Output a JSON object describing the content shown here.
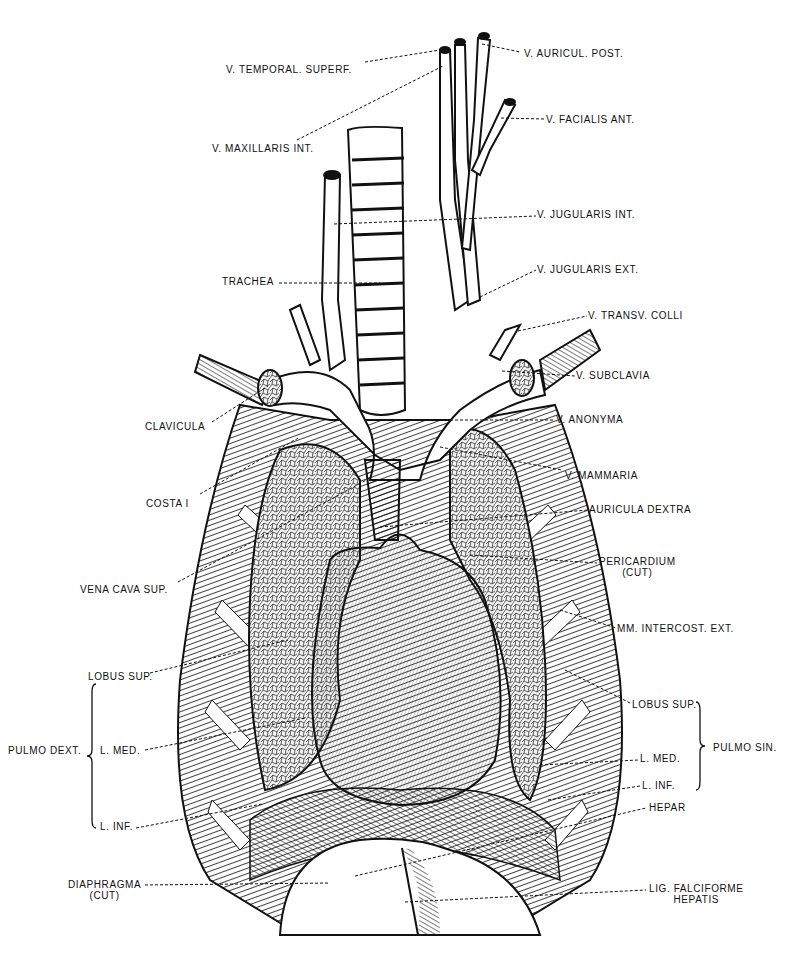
{
  "figure": {
    "colors": {
      "ink": "#111111",
      "paper": "#ffffff",
      "shade": "#2a2a2a",
      "lung": "#e9e9e9"
    }
  },
  "labels": [
    {
      "id": "v-temporal-superf",
      "text": "V. TEMPORAL. SUPERF.",
      "x": 226,
      "y": 64,
      "lx1": 365,
      "ly1": 62,
      "lx2": 440,
      "ly2": 50
    },
    {
      "id": "v-auricul-post",
      "text": "V. AURICUL. POST.",
      "x": 524,
      "y": 48,
      "lx1": 482,
      "ly1": 44,
      "lx2": 520,
      "ly2": 52
    },
    {
      "id": "v-maxillaris-int",
      "text": "V. MAXILLARIS INT.",
      "x": 212,
      "y": 143,
      "lx1": 297,
      "ly1": 140,
      "lx2": 443,
      "ly2": 66
    },
    {
      "id": "v-facialis-ant",
      "text": "V. FACIALIS ANT.",
      "x": 546,
      "y": 114,
      "lx1": 501,
      "ly1": 118,
      "lx2": 544,
      "ly2": 119
    },
    {
      "id": "v-jugularis-int",
      "text": "V. JUGULARIS INT.",
      "x": 537,
      "y": 209,
      "lx1": 334,
      "ly1": 224,
      "lx2": 536,
      "ly2": 216
    },
    {
      "id": "trachea",
      "text": "TRACHEA",
      "x": 222,
      "y": 276,
      "lx1": 279,
      "ly1": 283,
      "lx2": 380,
      "ly2": 283
    },
    {
      "id": "v-jugularis-ext",
      "text": "V. JUGULARIS EXT.",
      "x": 537,
      "y": 264,
      "lx1": 480,
      "ly1": 297,
      "lx2": 536,
      "ly2": 270
    },
    {
      "id": "v-transv-colli",
      "text": "V. TRANSV. COLLI",
      "x": 588,
      "y": 310,
      "lx1": 518,
      "ly1": 331,
      "lx2": 587,
      "ly2": 316
    },
    {
      "id": "v-subclavia",
      "text": "V. SUBCLAVIA",
      "x": 576,
      "y": 370,
      "lx1": 502,
      "ly1": 371,
      "lx2": 575,
      "ly2": 376
    },
    {
      "id": "clavicula",
      "text": "CLAVICULA",
      "x": 145,
      "y": 421,
      "lx1": 212,
      "ly1": 422,
      "lx2": 268,
      "ly2": 386
    },
    {
      "id": "v-anonyma",
      "text": "V. ANONYMA",
      "x": 556,
      "y": 414,
      "lx1": 410,
      "ly1": 420,
      "lx2": 555,
      "ly2": 420
    },
    {
      "id": "costa-i",
      "text": "COSTA I",
      "x": 146,
      "y": 498,
      "lx1": 200,
      "ly1": 494,
      "lx2": 300,
      "ly2": 437
    },
    {
      "id": "v-mammaria",
      "text": "V. MAMMARIA",
      "x": 565,
      "y": 470,
      "lx1": 440,
      "ly1": 447,
      "lx2": 562,
      "ly2": 470
    },
    {
      "id": "auricula-dextra",
      "text": "AURICULA DEXTRA",
      "x": 589,
      "y": 504,
      "lx1": 380,
      "ly1": 527,
      "lx2": 588,
      "ly2": 510
    },
    {
      "id": "vena-cava-sup",
      "text": "VENA CAVA SUP.",
      "x": 80,
      "y": 584,
      "lx1": 178,
      "ly1": 582,
      "lx2": 370,
      "ly2": 478
    },
    {
      "id": "pericardium-cut",
      "text": "PERICARDIUM",
      "sub": "(CUT)",
      "x": 599,
      "y": 556,
      "lx1": 470,
      "ly1": 555,
      "lx2": 597,
      "ly2": 563
    },
    {
      "id": "mm-intercost-ext",
      "text": "MM. INTERCOST. EXT.",
      "x": 617,
      "y": 623,
      "lx1": 560,
      "ly1": 610,
      "lx2": 616,
      "ly2": 628
    },
    {
      "id": "lobus-sup-dext",
      "text": "LOBUS SUP.",
      "x": 88,
      "y": 671,
      "lx1": 150,
      "ly1": 673,
      "lx2": 288,
      "ly2": 640
    },
    {
      "id": "l-med-dext",
      "text": "L. MED.",
      "x": 100,
      "y": 745,
      "lx1": 145,
      "ly1": 750,
      "lx2": 305,
      "ly2": 718
    },
    {
      "id": "l-inf-dext",
      "text": "L. INF.",
      "x": 100,
      "y": 821,
      "lx1": 136,
      "ly1": 828,
      "lx2": 262,
      "ly2": 804
    },
    {
      "id": "diaphragma-cut",
      "text": "DIAPHRAGMA",
      "sub": "(CUT)",
      "x": 68,
      "y": 879,
      "lx1": 145,
      "ly1": 885,
      "lx2": 330,
      "ly2": 883
    },
    {
      "id": "lobus-sup-sin",
      "text": "LOBUS SUP.",
      "x": 632,
      "y": 699,
      "lx1": 565,
      "ly1": 670,
      "lx2": 630,
      "ly2": 703
    },
    {
      "id": "l-med-sin",
      "text": "L. MED.",
      "x": 640,
      "y": 753,
      "lx1": 540,
      "ly1": 765,
      "lx2": 638,
      "ly2": 760
    },
    {
      "id": "l-inf-sin",
      "text": "L. INF.",
      "x": 642,
      "y": 780,
      "lx1": 548,
      "ly1": 800,
      "lx2": 640,
      "ly2": 786
    },
    {
      "id": "hepar",
      "text": "HEPAR",
      "x": 649,
      "y": 802,
      "lx1": 355,
      "ly1": 876,
      "lx2": 646,
      "ly2": 808
    },
    {
      "id": "lig-falciforme-hepatis",
      "text": "LIG. FALCIFORME",
      "sub": "HEPATIS",
      "x": 649,
      "y": 883,
      "lx1": 405,
      "ly1": 902,
      "lx2": 646,
      "ly2": 890
    }
  ],
  "groups": [
    {
      "id": "pulmo-dext",
      "text": "PULMO DEXT.",
      "x": 8,
      "y": 745,
      "brace_x": 92,
      "brace_top": 684,
      "brace_bottom": 828,
      "side": "left"
    },
    {
      "id": "pulmo-sin",
      "text": "PULMO SIN.",
      "x": 713,
      "y": 742,
      "brace_x": 700,
      "brace_top": 702,
      "brace_bottom": 790,
      "side": "right"
    }
  ]
}
